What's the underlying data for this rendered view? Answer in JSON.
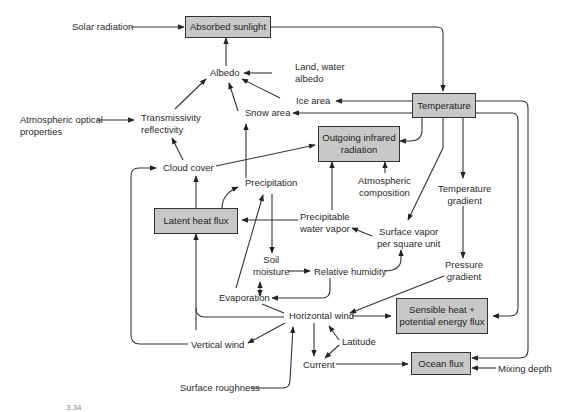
{
  "diagram": {
    "boxes": {
      "absorbed_sunlight": "Absorbed sunlight",
      "temperature": "Temperature",
      "outgoing_ir_1": "Outgoing infrared",
      "outgoing_ir_2": "radiation",
      "latent_heat_flux": "Latent heat flux",
      "sensible_heat_1": "Sensible heat +",
      "sensible_heat_2": "potential energy flux",
      "ocean_flux": "Ocean flux"
    },
    "nodes": {
      "solar_radiation": "Solar radiation",
      "albedo": "Albedo",
      "land_water_albedo_1": "Land,  water",
      "land_water_albedo_2": "albedo",
      "ice_area": "Ice area",
      "snow_area": "Snow area",
      "atm_optical_1": "Atmospheric optical",
      "atm_optical_2": "properties",
      "transmissivity_1": "Transmissivity",
      "transmissivity_2": "reflectivity",
      "cloud_cover": "Cloud cover",
      "precipitation": "Precipitation",
      "atm_composition_1": "Atmospheric",
      "atm_composition_2": "composition",
      "temperature_gradient_1": "Temperature",
      "temperature_gradient_2": "gradient",
      "precipitable_1": "Precipitable",
      "precipitable_2": "water vapor",
      "surface_vapor_1": "Surface vapor",
      "surface_vapor_2": "per square unit",
      "soil_moisture_1": "Soil",
      "soil_moisture_2": "moisture",
      "relative_humidity": "Relative humidity",
      "pressure_gradient_1": "Pressure",
      "pressure_gradient_2": "gradient",
      "evaporation": "Evaporation",
      "horizontal_wind": "Horizontal wind",
      "vertical_wind": "Vertical wind",
      "latitude": "Latitude",
      "current": "Current",
      "mixing_depth": "Mixing depth",
      "surface_roughness": "Surface roughness"
    },
    "caption": "3.34"
  }
}
